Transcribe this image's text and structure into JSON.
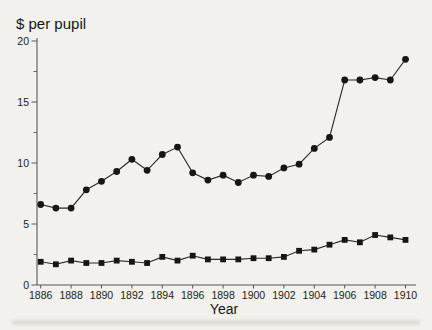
{
  "chart_data": {
    "type": "line",
    "title": "$ per pupil",
    "xlabel": "Year",
    "grid": false,
    "legend": "none",
    "xlim": [
      1886,
      1910
    ],
    "ylim": [
      0,
      20
    ],
    "xticks": [
      1886,
      1888,
      1890,
      1892,
      1894,
      1896,
      1898,
      1900,
      1902,
      1904,
      1906,
      1908,
      1910
    ],
    "yticks": [
      0,
      5,
      10,
      15,
      20
    ],
    "yticks_minor": [
      2.5,
      7.5,
      12.5,
      17.5
    ],
    "x": [
      1886,
      1887,
      1888,
      1889,
      1890,
      1891,
      1892,
      1893,
      1894,
      1895,
      1896,
      1897,
      1898,
      1899,
      1900,
      1901,
      1902,
      1903,
      1904,
      1905,
      1906,
      1907,
      1908,
      1909,
      1910
    ],
    "series": [
      {
        "name": "circles",
        "marker": "circle",
        "values": [
          6.6,
          6.3,
          6.3,
          7.8,
          8.5,
          9.3,
          10.3,
          9.4,
          10.7,
          11.3,
          9.2,
          8.6,
          9.0,
          8.4,
          9.0,
          8.9,
          9.6,
          9.9,
          11.2,
          12.1,
          16.8,
          16.8,
          17.0,
          16.8,
          18.5
        ]
      },
      {
        "name": "squares",
        "marker": "square",
        "values": [
          1.9,
          1.7,
          2.0,
          1.8,
          1.8,
          2.0,
          1.9,
          1.8,
          2.3,
          2.0,
          2.4,
          2.1,
          2.1,
          2.1,
          2.2,
          2.2,
          2.3,
          2.8,
          2.9,
          3.3,
          3.7,
          3.5,
          4.1,
          3.9,
          3.7
        ]
      }
    ],
    "style": {
      "background": "#f2f1ed",
      "ink": "#161616",
      "line": "#2a2a2a",
      "axis": "#58585a",
      "smudge": "#b9b9b2"
    }
  }
}
